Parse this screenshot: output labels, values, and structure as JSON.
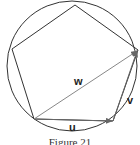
{
  "figure": {
    "caption": "Figure 21",
    "shapes": {
      "circle": {
        "cx": 72,
        "cy": 66,
        "r": 65
      },
      "pentagon": [
        [
          75,
          5
        ],
        [
          138,
          50
        ],
        [
          113,
          121
        ],
        [
          34,
          119
        ],
        [
          12,
          49
        ]
      ]
    },
    "vectors": [
      {
        "name": "u",
        "from": [
          34,
          119
        ],
        "to": [
          113,
          121
        ]
      },
      {
        "name": "v",
        "from": [
          113,
          121
        ],
        "to": [
          138,
          50
        ]
      },
      {
        "name": "w",
        "from": [
          34,
          119
        ],
        "to": [
          138,
          50
        ]
      }
    ],
    "labels": {
      "u": "u",
      "v": "v",
      "w": "w"
    },
    "colors": {
      "stroke": "#333333",
      "vector": "#666666",
      "background": "#ffffff"
    }
  }
}
